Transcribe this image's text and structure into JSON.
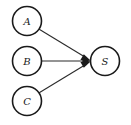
{
  "diagram": {
    "background_color": "#ffffff",
    "node_stroke_color": "#1a1a1a",
    "node_fill_color": "#ffffff",
    "edge_color": "#2b2b2b",
    "label_color": "#1a1a1a",
    "nodes": [
      {
        "id": "A",
        "label": "A",
        "cx": 27,
        "cy": 21,
        "r": 14.5,
        "role": "source"
      },
      {
        "id": "B",
        "label": "B",
        "cx": 27,
        "cy": 61,
        "r": 14.5,
        "role": "source"
      },
      {
        "id": "C",
        "label": "C",
        "cx": 27,
        "cy": 101,
        "r": 14.5,
        "role": "source"
      },
      {
        "id": "S",
        "label": "S",
        "cx": 105,
        "cy": 61,
        "r": 14.5,
        "role": "target"
      }
    ],
    "edges": [
      {
        "id": "A-S",
        "from": "A",
        "to": "S",
        "directed": true,
        "arrowhead": "filled-triangle"
      },
      {
        "id": "B-S",
        "from": "B",
        "to": "S",
        "directed": true,
        "arrowhead": "filled-triangle"
      },
      {
        "id": "C-S",
        "from": "C",
        "to": "S",
        "directed": true,
        "arrowhead": "filled-triangle"
      }
    ]
  }
}
